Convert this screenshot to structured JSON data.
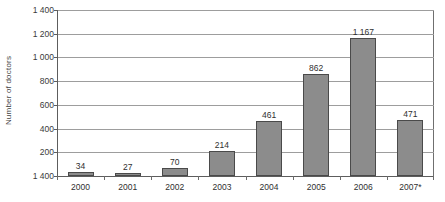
{
  "chart_data": {
    "type": "bar",
    "title": "",
    "xlabel": "",
    "ylabel": "Number of doctors",
    "categories": [
      "2000",
      "2001",
      "2002",
      "2003",
      "2004",
      "2005",
      "2006",
      "2007*"
    ],
    "values": [
      34,
      27,
      70,
      214,
      461,
      862,
      1167,
      471
    ],
    "value_labels": [
      "34",
      "27",
      "70",
      "214",
      "461",
      "862",
      "1 167",
      "471"
    ],
    "ylim": [
      0,
      1400
    ],
    "ytick_values": [
      1400,
      1200,
      1000,
      800,
      600,
      400,
      200,
      0
    ],
    "ytick_labels": [
      "1 400",
      "1 200",
      "1 000",
      "800",
      "600",
      "400",
      "200",
      "1 400"
    ],
    "grid": true,
    "legend": false,
    "bar_color": "#8c8c8c",
    "bar_border_color": "#4a4a4a",
    "gridline_color": "#9d9d9d",
    "axis_color": "#5d5d5d",
    "background_color": "#ffffff"
  }
}
